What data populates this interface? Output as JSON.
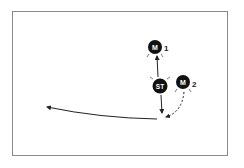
{
  "diagram": {
    "type": "play-diagram",
    "players": [
      {
        "id": "M1",
        "label": "M",
        "number": "1",
        "x": 155,
        "y": 47
      },
      {
        "id": "ST",
        "label": "ST",
        "number": "",
        "x": 160,
        "y": 86
      },
      {
        "id": "M2",
        "label": "M",
        "number": "2",
        "x": 183,
        "y": 82
      }
    ],
    "paths": [
      {
        "from": "ST",
        "to": "M1",
        "style": "solid",
        "meaning": "pass"
      },
      {
        "from": "ST",
        "to": "point",
        "style": "solid",
        "meaning": "run"
      },
      {
        "from": "M2",
        "to": "point",
        "style": "dashed",
        "meaning": "run"
      },
      {
        "from": "point",
        "to": "left",
        "style": "solid",
        "meaning": "pass"
      }
    ],
    "colors": {
      "player_fill": "#111111",
      "player_text": "#ffffff",
      "line": "#222222",
      "border": "#8a8a8a"
    }
  }
}
